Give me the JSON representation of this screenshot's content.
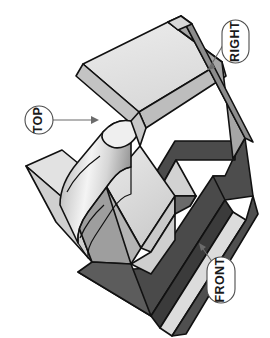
{
  "figure": {
    "type": "isometric-technical-drawing",
    "background_color": "#ffffff",
    "outline_color": "#111111"
  },
  "callouts": [
    {
      "id": "right",
      "label": "RIGHT",
      "shape": "pill",
      "text_orientation": "vertical",
      "leader": "line-to-upper-right-face",
      "x": 222,
      "y": 20,
      "width": 27,
      "height": 43
    },
    {
      "id": "top",
      "label": "TOP",
      "shape": "circle",
      "text_orientation": "vertical",
      "leader": "horizontal-arrow-right",
      "x": 25,
      "y": 106,
      "width": 28,
      "height": 28
    },
    {
      "id": "front",
      "label": "FRONT",
      "shape": "pill",
      "text_orientation": "vertical",
      "leader": "line-to-lower-front-face",
      "x": 207,
      "y": 257,
      "width": 28,
      "height": 46
    }
  ],
  "surfaces": {
    "top_face_label": "top",
    "front_face_label": "front",
    "right_face_label": "right",
    "colors": {
      "light": "#e6e6e6",
      "light_alt": "#dedede",
      "medium": "#bdbdbd",
      "medium_dark": "#9a9a9a",
      "dark": "#4d4d4d",
      "dark_alt": "#5a5a5a",
      "darkest": "#3f3f3f",
      "cylinder_light": "#f2f2f2",
      "cylinder_dark": "#909090"
    }
  },
  "features": [
    {
      "name": "upper-plate",
      "description": "large light rectangular slab at upper area"
    },
    {
      "name": "right-wall",
      "description": "dark vertical wall on right side"
    },
    {
      "name": "base-plate",
      "description": "dark angled base plate at bottom"
    },
    {
      "name": "cylindrical-boss",
      "description": "vertical cylinder with shaded gradient at center"
    },
    {
      "name": "notch-cutout",
      "description": "triangular notch cut into right wall"
    },
    {
      "name": "left-rib",
      "description": "light rib projecting to the left"
    }
  ]
}
